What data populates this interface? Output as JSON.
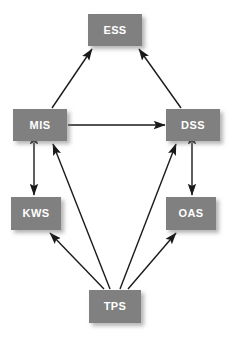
{
  "diagram": {
    "background_color": "#ffffff",
    "node_fill_color": "#808080",
    "node_text_color": "#ffffff",
    "edge_color": "#1a1a1a",
    "nodes": [
      {
        "id": "ESS",
        "label": "ESS",
        "x": 88,
        "y": 14,
        "width": 54,
        "height": 32
      },
      {
        "id": "MIS",
        "label": "MIS",
        "x": 13,
        "y": 109,
        "width": 54,
        "height": 32
      },
      {
        "id": "DSS",
        "label": "DSS",
        "x": 166,
        "y": 109,
        "width": 54,
        "height": 32
      },
      {
        "id": "KWS",
        "label": "KWS",
        "x": 11,
        "y": 197,
        "width": 50,
        "height": 33
      },
      {
        "id": "OAS",
        "label": "OAS",
        "x": 166,
        "y": 197,
        "width": 50,
        "height": 33
      },
      {
        "id": "TPS",
        "label": "TPS",
        "x": 89,
        "y": 290,
        "width": 52,
        "height": 33
      }
    ],
    "edges": [
      {
        "id": "mis-ess",
        "from": "MIS",
        "to": "ESS",
        "direction": "one-way",
        "x1": 52,
        "y1": 108,
        "x2": 92,
        "y2": 49
      },
      {
        "id": "dss-ess",
        "from": "DSS",
        "to": "ESS",
        "direction": "one-way",
        "x1": 181,
        "y1": 108,
        "x2": 139,
        "y2": 49
      },
      {
        "id": "mis-dss",
        "from": "MIS",
        "to": "DSS",
        "direction": "one-way",
        "x1": 68,
        "y1": 125,
        "x2": 165,
        "y2": 125
      },
      {
        "id": "mis-kws",
        "from": "MIS",
        "to": "KWS",
        "direction": "two-way",
        "x1": 34,
        "y1": 143,
        "x2": 34,
        "y2": 195
      },
      {
        "id": "dss-oas",
        "from": "DSS",
        "to": "OAS",
        "direction": "two-way",
        "x1": 192,
        "y1": 143,
        "x2": 192,
        "y2": 195
      },
      {
        "id": "tps-kws",
        "from": "TPS",
        "to": "KWS",
        "direction": "one-way",
        "x1": 104,
        "y1": 289,
        "x2": 50,
        "y2": 233
      },
      {
        "id": "tps-mis",
        "from": "TPS",
        "to": "MIS",
        "direction": "one-way",
        "x1": 110,
        "y1": 289,
        "x2": 53,
        "y2": 144
      },
      {
        "id": "tps-dss",
        "from": "TPS",
        "to": "DSS",
        "direction": "one-way",
        "x1": 120,
        "y1": 289,
        "x2": 176,
        "y2": 144
      },
      {
        "id": "tps-oas",
        "from": "TPS",
        "to": "OAS",
        "direction": "one-way",
        "x1": 128,
        "y1": 289,
        "x2": 176,
        "y2": 233
      }
    ]
  }
}
